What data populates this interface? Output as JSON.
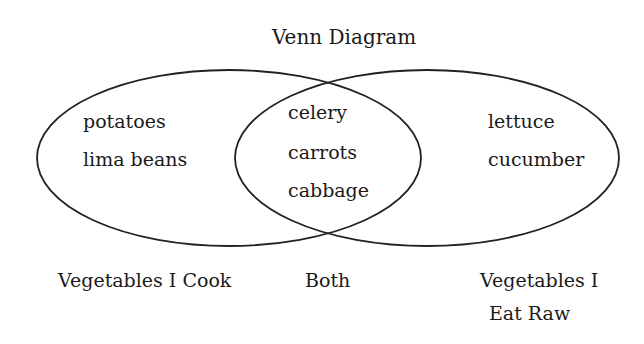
{
  "diagram": {
    "title": "Venn Diagram",
    "sets": [
      {
        "name": "Vegetables I Cook",
        "label_lines": [
          "Vegetables I Cook"
        ],
        "only_items": [
          "potatoes",
          "lima beans"
        ]
      },
      {
        "name": "Vegetables I Eat Raw",
        "label_lines": [
          "Vegetables I",
          "Eat Raw"
        ],
        "only_items": [
          "lettuce",
          "cucumber"
        ]
      }
    ],
    "intersection": {
      "label": "Both",
      "items": [
        "celery",
        "carrots",
        "cabbage"
      ]
    },
    "colors": {
      "stroke": "#222222",
      "text": "#1a1a1a",
      "background": "#ffffff"
    }
  }
}
